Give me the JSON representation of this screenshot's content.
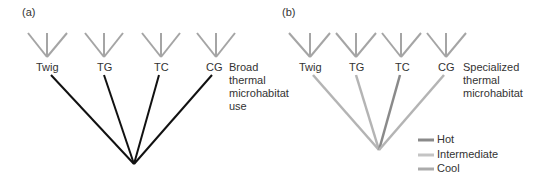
{
  "panels": [
    {
      "id": "a",
      "label": "(a)",
      "taxa": [
        "Twig",
        "TG",
        "TC",
        "CG"
      ],
      "note": [
        "Broad",
        "thermal",
        "microhabitat",
        "use"
      ]
    },
    {
      "id": "b",
      "label": "(b)",
      "taxa": [
        "Twig",
        "TG",
        "TC",
        "CG"
      ],
      "note": [
        "Specialized",
        "thermal",
        "microhabitat"
      ]
    }
  ],
  "legend": [
    {
      "label": "Hot",
      "color": "#8a8a8a"
    },
    {
      "label": "Intermediate",
      "color": "#c4c4c4"
    },
    {
      "label": "Cool",
      "color": "#ababab"
    }
  ],
  "colors": {
    "trident": "#a5a5a5",
    "panel_a_branch": "#111111",
    "hot": "#8a8a8a",
    "intermediate": "#c4c4c4",
    "cool": "#ababab"
  }
}
